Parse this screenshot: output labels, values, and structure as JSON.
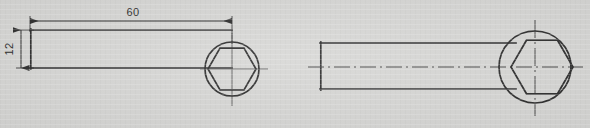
{
  "drawing": {
    "title": "Hexagon-socket bar two-view engineering drawing",
    "background_color": "#d7d7d5",
    "line_color": "#2e2e2e",
    "text_color": "#2b2b2b",
    "units": "mm (implied)",
    "projection": "two orthographic views, side by side"
  },
  "dimensions": {
    "length_label": "60",
    "height_label": "12"
  },
  "views": [
    {
      "name": "left-view",
      "label": "dimensioned view",
      "bar": {
        "x": 30,
        "y": 30,
        "width": 202,
        "height": 38
      },
      "circle": {
        "cx": 232,
        "cy": 69,
        "r": 27
      },
      "hexagon": {
        "cx": 232,
        "cy": 69,
        "r": 24,
        "orientation": "vertex-left-right"
      },
      "has_bar_centerline": false,
      "has_circle_centerlines": true,
      "dimensions_shown": [
        "60",
        "12"
      ]
    },
    {
      "name": "right-view",
      "label": "centerline view",
      "bar": {
        "x": 320,
        "y": 43,
        "width": 196,
        "height": 46
      },
      "circle": {
        "cx": 535,
        "cy": 67,
        "r": 36
      },
      "hexagon": {
        "cx": 542,
        "cy": 67,
        "r": 31,
        "orientation": "vertex-left-right"
      },
      "has_bar_centerline": true,
      "has_circle_centerlines": true,
      "dimensions_shown": []
    }
  ],
  "annotations": {
    "length_dimension": {
      "value": "60",
      "line_y": 21,
      "from_x": 30,
      "to_x": 232,
      "text_x": 133,
      "text_y": 14
    },
    "height_dimension": {
      "value": "12",
      "line_x": 21,
      "from_y": 30,
      "to_y": 68,
      "text_x": 13,
      "text_y": 49,
      "rotated": true
    }
  }
}
